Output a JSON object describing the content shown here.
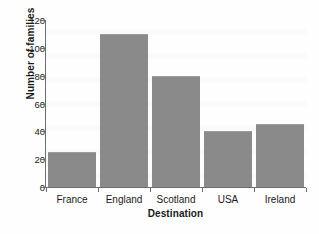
{
  "chart_data": {
    "type": "bar",
    "title": "",
    "subtitle": "",
    "categories": [
      "France",
      "England",
      "Scotland",
      "USA",
      "Ireland"
    ],
    "values": [
      25,
      110,
      80,
      40,
      45
    ],
    "xlabel": "Destination",
    "ylabel": "Number of families",
    "ylim": [
      0,
      120
    ],
    "yticks": [
      0,
      20,
      40,
      60,
      80,
      100,
      120
    ],
    "ytick_labels": [
      "0",
      "20",
      "40",
      "60",
      "80",
      "100",
      "120"
    ],
    "grid": false,
    "legend": null,
    "bar_color": "#8a8a8a",
    "axis_color": "#6e6e6e",
    "text_color": "#1a1a1a",
    "background_color": "#fefefe"
  }
}
